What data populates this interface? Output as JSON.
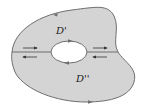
{
  "figure": {
    "type": "region-with-hole-decomposition",
    "labels": {
      "upper_region": "D'",
      "lower_region": "D''"
    },
    "colors": {
      "region_fill": "#d4d4d4",
      "boundary": "#6e6e6e",
      "hole_fill": "#ffffff",
      "arrow": "#333333",
      "background": "#ffffff"
    },
    "arrows": {
      "outer_top": "left",
      "outer_bottom": "right",
      "hole_top": "right",
      "hole_bottom": "left",
      "cut_left_upper": "right",
      "cut_left_lower": "left",
      "cut_right_upper": "right",
      "cut_right_lower": "left"
    }
  }
}
